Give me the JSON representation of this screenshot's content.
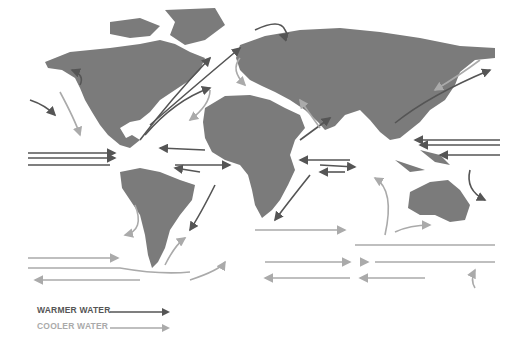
{
  "map": {
    "title": "World ocean currents",
    "colors": {
      "land": "#7b7b7b",
      "warmer": "#555555",
      "cooler": "#aaaaaa",
      "background": "#ffffff"
    }
  },
  "legend": {
    "items": [
      {
        "label": "WARMER WATER",
        "color": "#555555",
        "icon": "arrow-right-icon"
      },
      {
        "label": "COOLER WATER",
        "color": "#aaaaaa",
        "icon": "arrow-right-icon"
      }
    ]
  }
}
